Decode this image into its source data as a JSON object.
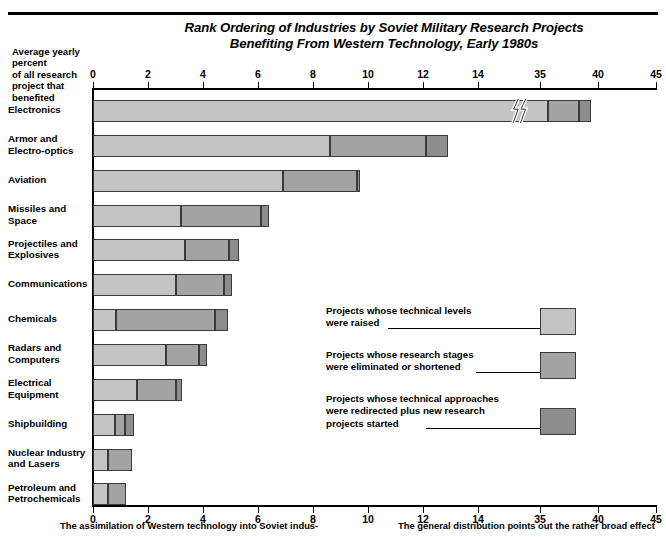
{
  "chart_data": {
    "type": "bar",
    "orientation": "horizontal",
    "stacked": true,
    "title": "Rank Ordering of Industries by Soviet Military Research Projects Benefiting From Western Technology, Early 1980s",
    "title_lines": [
      "Rank Ordering of Industries by Soviet Military Research Projects",
      "Benefiting From Western Technology, Early 1980s"
    ],
    "ylabel": "Average yearly percent of all research project that benefited",
    "ylabel_lines": [
      "Average yearly percent",
      "of all research",
      "project  that",
      "benefited"
    ],
    "xlabel": "",
    "grid": false,
    "axis_break_between": [
      14,
      35
    ],
    "xticks": [
      0,
      2,
      4,
      6,
      8,
      10,
      12,
      14,
      35,
      40,
      45
    ],
    "xtick_px": [
      93,
      148,
      203,
      258,
      313,
      368,
      423,
      478,
      540,
      598,
      656
    ],
    "categories": [
      "Electronics",
      "Armor and Electro-optics",
      "Aviation",
      "Missiles and Space",
      "Projectiles and Explosives",
      "Communications",
      "Chemicals",
      "Radars and Computers",
      "Electrical Equipment",
      "Shipbuilding",
      "Nuclear Industry and Lasers",
      "Petroleum and Petrochemicals"
    ],
    "category_lines": [
      [
        "Electronics"
      ],
      [
        "Armor and",
        "Electro-optics"
      ],
      [
        "Aviation"
      ],
      [
        "Missiles and",
        "Space"
      ],
      [
        "Projectiles and",
        "Explosives"
      ],
      [
        "Communications"
      ],
      [
        "Chemicals"
      ],
      [
        "Radars and",
        "Computers"
      ],
      [
        "Electrical",
        "Equipment"
      ],
      [
        "Shipbuilding"
      ],
      [
        "Nuclear Industry",
        "and Lasers"
      ],
      [
        "Petroleum and",
        "Petrochemicals"
      ]
    ],
    "series": [
      {
        "name": "Projects whose technical levels were raised",
        "color": "#c4c4c4",
        "values": [
          35.7,
          8.6,
          6.9,
          3.2,
          3.35,
          3.0,
          0.85,
          2.65,
          1.6,
          0.8,
          0.55,
          0.55
        ]
      },
      {
        "name": "Projects whose research stages were eliminated or shortened",
        "color": "#a3a3a3",
        "values": [
          2.7,
          3.5,
          2.7,
          2.9,
          1.6,
          1.75,
          3.6,
          1.2,
          1.4,
          0.35,
          0.85,
          0.65
        ]
      },
      {
        "name": "Projects whose technical approaches were redirected plus new research projects started",
        "color": "#8d8d8d",
        "values": [
          1.0,
          0.8,
          0.1,
          0.3,
          0.35,
          0.3,
          0.45,
          0.3,
          0.25,
          0.35,
          0.0,
          0.0
        ]
      }
    ],
    "totals": [
      42.1,
      12.9,
      9.7,
      6.4,
      5.3,
      5.05,
      4.9,
      4.15,
      3.25,
      1.5,
      1.4,
      1.2
    ]
  },
  "legend": {
    "position": "inside-right",
    "items": [
      {
        "lines": [
          "Projects whose technical levels",
          "were raised"
        ],
        "color": "#c4c4c4",
        "swatch_name": "legend-swatch-levels-raised"
      },
      {
        "lines": [
          "Projects whose research stages",
          "were eliminated or shortened"
        ],
        "color": "#a3a3a3",
        "swatch_name": "legend-swatch-stages-shortened"
      },
      {
        "lines": [
          "Projects whose technical approaches",
          "were redirected plus new research",
          "projects started"
        ],
        "color": "#8d8d8d",
        "swatch_name": "legend-swatch-approaches-redirected"
      }
    ]
  },
  "caption": {
    "left": "The assimilation of Western technology into Soviet indus-",
    "right": "The general distribution points out the rather broad effect"
  },
  "colors": {
    "series_light": "#c4c4c4",
    "series_mid": "#a3a3a3",
    "series_dark": "#8d8d8d",
    "axis": "#000000",
    "background": "#ffffff",
    "bar_outline": "#3a3a3a"
  }
}
